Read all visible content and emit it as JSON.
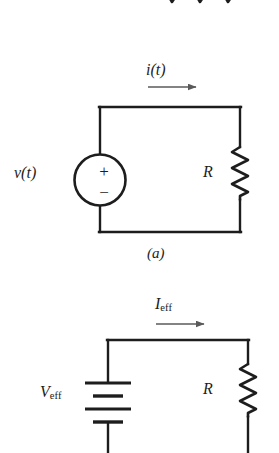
{
  "figure": {
    "background_color": "#ffffff",
    "line_color": "#1d1d1d",
    "arrow_color": "#5a5a5a",
    "width": 279,
    "height": 453
  },
  "top_partial": {
    "description": "bottom tips of a cut-off resistor zigzag",
    "visible_vertex_count": 3
  },
  "circuit_a": {
    "caption": "(a)",
    "current_label": "i(t)",
    "source_label": "v(t)",
    "source_type": "ac-voltage-source-circle",
    "source_polarity_plus": "+",
    "source_polarity_minus": "−",
    "resistor_label": "R",
    "current_direction": "right"
  },
  "circuit_b": {
    "caption": "",
    "current_label_main": "I",
    "current_label_sub": "eff",
    "source_label_main": "V",
    "source_label_sub": "eff",
    "source_type": "dc-battery",
    "battery_plate_count": 4,
    "resistor_label": "R",
    "current_direction": "right"
  }
}
